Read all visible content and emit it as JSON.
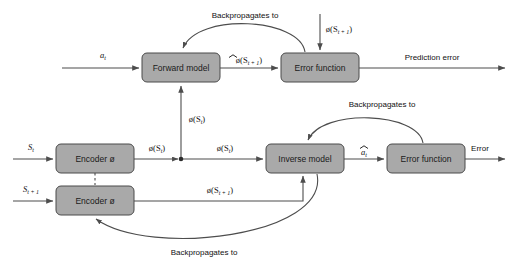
{
  "diagram": {
    "colors": {
      "box_fill": "#a9a9a9",
      "box_stroke": "#4a4a4a",
      "edge": "#4d4d4d",
      "text": "#111111",
      "background": "#ffffff"
    },
    "nodes": [
      {
        "id": "forward-model",
        "label": "Forward model",
        "x": 142,
        "y": 53,
        "w": 78,
        "h": 29
      },
      {
        "id": "error-function-top",
        "label": "Error function",
        "x": 281,
        "y": 53,
        "w": 78,
        "h": 29
      },
      {
        "id": "encoder-st",
        "label": "Encoder ø",
        "x": 56,
        "y": 144,
        "w": 78,
        "h": 29
      },
      {
        "id": "encoder-st1",
        "label": "Encoder ø",
        "x": 56,
        "y": 186,
        "w": 78,
        "h": 29
      },
      {
        "id": "inverse-model",
        "label": "Inverse model",
        "x": 266,
        "y": 144,
        "w": 78,
        "h": 29
      },
      {
        "id": "error-function-bottom",
        "label": "Error function",
        "x": 387,
        "y": 144,
        "w": 78,
        "h": 29
      }
    ],
    "edge_labels": {
      "action_input": "a",
      "action_input_sub": "t",
      "state_input": "S",
      "state_input_sub": "t",
      "next_state_input": "S",
      "next_state_input_sub": "t + 1",
      "phi_st_vertical": "ø(S",
      "phi_st_vertical_sub": "t",
      "phi_st_from_encoder": "ø(S",
      "phi_st_to_inverse": "ø(S",
      "phi_st1_to_error": "ø(S",
      "phi_st1_sub": "t + 1",
      "phi_st1_to_inverse": "ø(S",
      "phi_hat_st1": "ø(S",
      "a_hat": "a",
      "a_hat_sub": "t",
      "prediction_error": "Prediction error",
      "error": "Error",
      "backprop_top": "Backpropagates to",
      "backprop_middle": "Backpropagates to",
      "backprop_bottom": "Backpropagates to"
    }
  }
}
